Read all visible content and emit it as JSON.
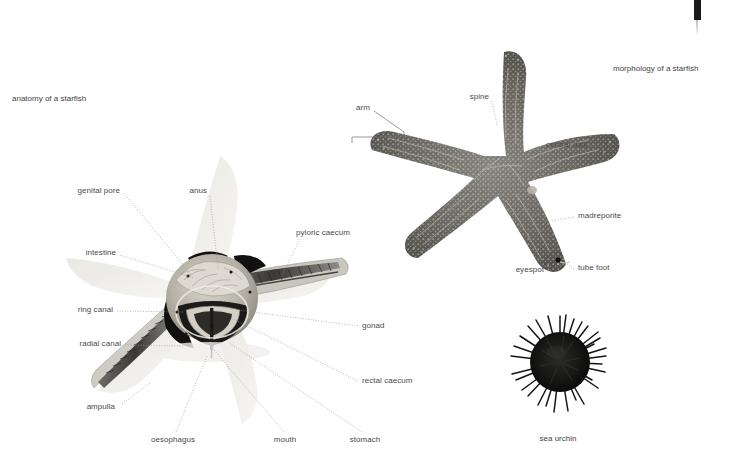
{
  "page": {
    "background_color": "#ffffff",
    "width": 736,
    "height": 473
  },
  "figures": [
    {
      "id": "anatomy",
      "caption": "anatomy of a starfish",
      "caption_position": {
        "x": 12,
        "y": 94
      },
      "subject": "dissected starfish showing internal organs",
      "labels": [
        {
          "name": "genital-pore",
          "text": "genital pore",
          "align": "right",
          "x": 120,
          "y": 191,
          "tip_x": 192,
          "tip_y": 276,
          "leader": "dotted"
        },
        {
          "name": "anus",
          "text": "anus",
          "align": "right",
          "x": 207,
          "y": 191,
          "tip_x": 218,
          "tip_y": 269,
          "leader": "dotted"
        },
        {
          "name": "intestine",
          "text": "intestine",
          "align": "right",
          "x": 116,
          "y": 253,
          "tip_x": 194,
          "tip_y": 278,
          "leader": "dotted"
        },
        {
          "name": "ring-canal",
          "text": "ring canal",
          "align": "right",
          "x": 113,
          "y": 310,
          "tip_x": 184,
          "tip_y": 312,
          "leader": "dotted"
        },
        {
          "name": "radial-canal",
          "text": "radial canal",
          "align": "right",
          "x": 121,
          "y": 344,
          "tip_x": 183,
          "tip_y": 346,
          "leader": "dotted"
        },
        {
          "name": "ampulla",
          "text": "ampulla",
          "align": "right",
          "x": 115,
          "y": 407,
          "tip_x": 150,
          "tip_y": 383,
          "leader": "dotted"
        },
        {
          "name": "oesophagus",
          "text": "oesophagus",
          "align": "center",
          "x": 173,
          "y": 440,
          "tip_x": 207,
          "tip_y": 356,
          "leader": "dotted"
        },
        {
          "name": "mouth",
          "text": "mouth",
          "align": "center",
          "x": 285,
          "y": 440,
          "tip_x": 214,
          "tip_y": 350,
          "leader": "dotted"
        },
        {
          "name": "stomach",
          "text": "stomach",
          "align": "center",
          "x": 365,
          "y": 440,
          "tip_x": 228,
          "tip_y": 342,
          "leader": "dotted"
        },
        {
          "name": "pyloric-caecum",
          "text": "pyloric caecum",
          "align": "left",
          "x": 296,
          "y": 233,
          "tip_x": 278,
          "tip_y": 283,
          "leader": "dotted"
        },
        {
          "name": "gonad",
          "text": "gonad",
          "align": "left",
          "x": 362,
          "y": 326,
          "tip_x": 238,
          "tip_y": 310,
          "leader": "dotted"
        },
        {
          "name": "rectal-caecum",
          "text": "rectal caecum",
          "align": "left",
          "x": 362,
          "y": 381,
          "tip_x": 231,
          "tip_y": 318,
          "leader": "dotted"
        }
      ]
    },
    {
      "id": "morphology",
      "caption": "morphology of a starfish",
      "caption_position": {
        "x": 613,
        "y": 64
      },
      "subject": "whole starfish photographed from above",
      "labels": [
        {
          "name": "spine",
          "text": "spine",
          "align": "right",
          "x": 489,
          "y": 97,
          "tip_x": 497,
          "tip_y": 125,
          "leader": "dotted"
        },
        {
          "name": "arm",
          "text": "arm",
          "align": "right",
          "x": 370,
          "y": 108,
          "tip_x": 404,
          "tip_y": 132,
          "leader": "solid"
        },
        {
          "name": "central-disk",
          "text": "central disk",
          "align": "left",
          "x": 546,
          "y": 145,
          "tip_x": 530,
          "tip_y": 152,
          "leader": "dotted"
        },
        {
          "name": "madreporite",
          "text": "madreporite",
          "align": "left",
          "x": 578,
          "y": 216,
          "tip_x": 553,
          "tip_y": 220,
          "leader": "dotted"
        },
        {
          "name": "eyespot",
          "text": "eyespot",
          "align": "right",
          "x": 544,
          "y": 270,
          "tip_x": 558,
          "tip_y": 263,
          "leader": "dotted"
        },
        {
          "name": "tube-foot",
          "text": "tube foot",
          "align": "left",
          "x": 578,
          "y": 268,
          "tip_x": 566,
          "tip_y": 262,
          "leader": "dotted"
        }
      ]
    },
    {
      "id": "sea-urchin",
      "caption": "sea urchin",
      "caption_position": {
        "x": 558,
        "y": 434
      },
      "subject": "sea urchin with dense dark spines",
      "labels": []
    }
  ],
  "artifacts": {
    "page_edge_strip": {
      "name": "page-edge-strip",
      "color": "#1b1b1b"
    }
  }
}
